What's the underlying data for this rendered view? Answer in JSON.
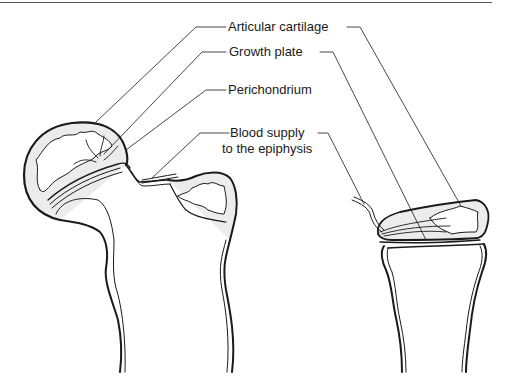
{
  "figure": {
    "type": "anatomical line illustration",
    "colors": {
      "line": "#1a1a1a",
      "fill_shade": "#e6e6e6",
      "background": "#ffffff"
    }
  },
  "labels": [
    {
      "id": "articular-cartilage",
      "text": "Articular cartilage"
    },
    {
      "id": "growth-plate",
      "text": "Growth plate"
    },
    {
      "id": "perichondrium",
      "text": "Perichondrium"
    },
    {
      "id": "blood-supply",
      "line1": "Blood supply",
      "line2": "to the epiphysis"
    }
  ],
  "structures": [
    {
      "id": "femur-head",
      "description": "Left bone: femoral head with epiphysis, neck and greater trochanter"
    },
    {
      "id": "bone-end-right",
      "description": "Right bone: flattened epiphysis above metaphysis and shaft"
    }
  ]
}
